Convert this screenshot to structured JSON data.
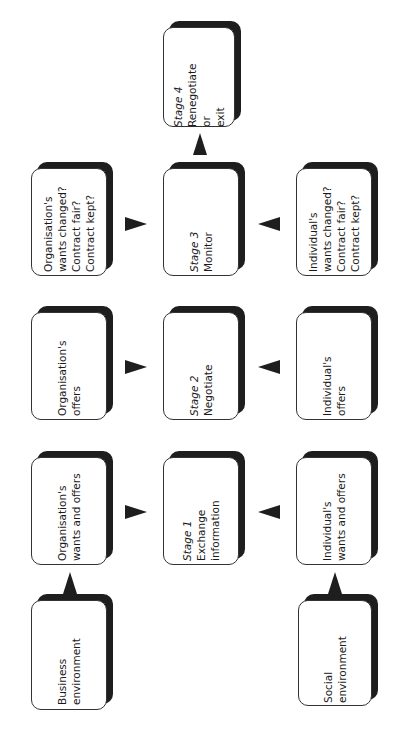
{
  "diagram": {
    "orientation": "rotated-90-ccw",
    "boxes": {
      "business_environment": {
        "lines": [
          "Business",
          "environment"
        ],
        "style": "bold"
      },
      "social_environment": {
        "lines": [
          "Social",
          "environment"
        ],
        "style": "bold"
      },
      "org_wants_offers": {
        "lines": [
          "Organisation's",
          "wants and offers"
        ]
      },
      "org_offers": {
        "lines": [
          "Organisation's",
          "offers"
        ]
      },
      "org_changed": {
        "lines": [
          "Organisation's",
          "wants changed?",
          "Contract fair?",
          "Contract kept?"
        ]
      },
      "ind_wants_offers": {
        "lines": [
          "Individual's",
          "wants and offers"
        ]
      },
      "ind_offers": {
        "lines": [
          "Individual's",
          "offers"
        ]
      },
      "ind_changed": {
        "lines": [
          "Individual's",
          "wants changed?",
          "Contract fair?",
          "Contract kept?"
        ]
      },
      "stage1": {
        "stage": "Stage 1",
        "lines": [
          "Exchange",
          "information"
        ]
      },
      "stage2": {
        "stage": "Stage 2",
        "lines": [
          "Negotiate"
        ]
      },
      "stage3": {
        "stage": "Stage 3",
        "lines": [
          "Monitor"
        ]
      },
      "stage4": {
        "stage": "Stage 4",
        "lines": [
          "Renegotiate",
          "or",
          "exit"
        ]
      }
    },
    "connections": [
      {
        "from": "business_environment",
        "to": "org_wants_offers"
      },
      {
        "from": "social_environment",
        "to": "ind_wants_offers"
      },
      {
        "from": "org_wants_offers",
        "to": "stage1"
      },
      {
        "from": "ind_wants_offers",
        "to": "stage1"
      },
      {
        "from": "org_offers",
        "to": "stage2"
      },
      {
        "from": "ind_offers",
        "to": "stage2"
      },
      {
        "from": "org_changed",
        "to": "stage3"
      },
      {
        "from": "ind_changed",
        "to": "stage3"
      },
      {
        "from": "stage3",
        "to": "stage4"
      }
    ],
    "colors": {
      "shadow": "#1e1e1e",
      "face": "#ffffff",
      "border": "#333333"
    }
  }
}
